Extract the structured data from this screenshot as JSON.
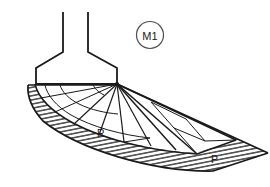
{
  "figure": {
    "title": "M1",
    "background_color": "#ffffff",
    "line_color": "#1a1a1a",
    "hatch_color": "#1a1a1a",
    "labels": {
      "callout": "M1",
      "point_r": "R",
      "point_p": "P"
    },
    "callout_circle": {
      "cx": 150,
      "cy": 35,
      "r": 13.5
    },
    "structure": {
      "name": "chute-hopper",
      "left_pipe_x": 63,
      "right_pipe_x": 88,
      "pipe_top_y": 12,
      "flare_start_y": 52,
      "base_left_x": 35,
      "base_right_x": 117,
      "base_y": 83
    },
    "fan": {
      "apex_x": 117,
      "apex_y": 84,
      "ray_count": 9
    },
    "hatching": {
      "angle_deg": 11,
      "spacing_px": 4
    }
  }
}
